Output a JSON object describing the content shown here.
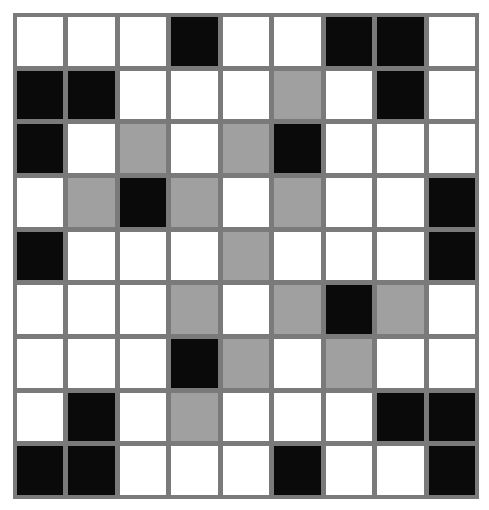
{
  "puzzle": {
    "rows": 9,
    "cols": 9,
    "legend": {
      "W": "white",
      "B": "black",
      "G": "grey"
    },
    "colors": {
      "white": "#ffffff",
      "black": "#0a0a0a",
      "grey": "#a0a0a0",
      "gridline": "#7a7a7a"
    },
    "grid": [
      [
        "W",
        "W",
        "W",
        "B",
        "W",
        "W",
        "B",
        "B",
        "W"
      ],
      [
        "B",
        "B",
        "W",
        "W",
        "W",
        "G",
        "W",
        "B",
        "W"
      ],
      [
        "B",
        "W",
        "G",
        "W",
        "G",
        "B",
        "W",
        "W",
        "W"
      ],
      [
        "W",
        "G",
        "B",
        "G",
        "W",
        "G",
        "W",
        "W",
        "B"
      ],
      [
        "B",
        "W",
        "W",
        "W",
        "G",
        "W",
        "W",
        "W",
        "B"
      ],
      [
        "W",
        "W",
        "W",
        "G",
        "W",
        "G",
        "B",
        "G",
        "W"
      ],
      [
        "W",
        "W",
        "W",
        "B",
        "G",
        "W",
        "G",
        "W",
        "W"
      ],
      [
        "W",
        "B",
        "W",
        "G",
        "W",
        "W",
        "W",
        "B",
        "B"
      ],
      [
        "B",
        "B",
        "W",
        "W",
        "W",
        "B",
        "W",
        "W",
        "B"
      ]
    ]
  }
}
